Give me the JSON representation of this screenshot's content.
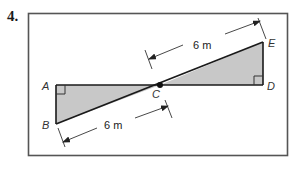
{
  "problem": {
    "number": "4."
  },
  "diagram": {
    "points": {
      "A": {
        "label": "A"
      },
      "B": {
        "label": "B"
      },
      "C": {
        "label": "C"
      },
      "D": {
        "label": "D"
      },
      "E": {
        "label": "E"
      }
    },
    "dimensions": {
      "CE": {
        "label": "6 m"
      },
      "BC": {
        "label": "6 m"
      }
    },
    "colors": {
      "fill": "#c8c8c8",
      "stroke": "#1a1a1a",
      "frame": "#555555"
    }
  }
}
